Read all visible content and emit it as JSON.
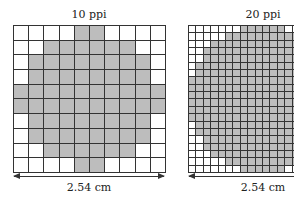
{
  "left": {
    "title": "10 ppi",
    "dimension_label": "2.54 cm",
    "rows": 10,
    "cols": 10,
    "filled_ranges": [
      [
        4,
        5
      ],
      [
        2,
        7
      ],
      [
        1,
        8
      ],
      [
        1,
        8
      ],
      [
        0,
        9
      ],
      [
        0,
        9
      ],
      [
        1,
        8
      ],
      [
        1,
        8
      ],
      [
        2,
        7
      ],
      [
        4,
        5
      ]
    ]
  },
  "right": {
    "title": "20 ppi",
    "dimension_label": "2.54 cm",
    "rows": 20,
    "cols": 20,
    "visible_cols": 15,
    "white_left_counts": [
      7,
      5,
      3,
      2,
      2,
      1,
      1,
      0,
      0,
      0,
      0,
      0,
      0,
      1,
      1,
      2,
      2,
      3,
      5,
      7
    ]
  },
  "colors": {
    "fill": "#bdbdbd",
    "empty": "#ffffff",
    "line": "#333333"
  }
}
